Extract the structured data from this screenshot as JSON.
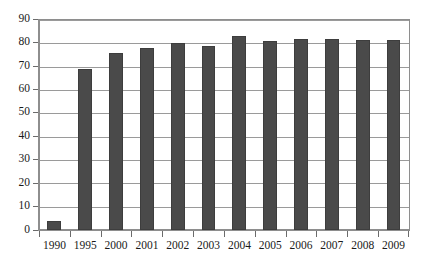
{
  "chart_data": {
    "type": "bar",
    "title": "",
    "subtitle": "",
    "xlabel": "",
    "ylabel": "",
    "categories": [
      "1990",
      "1995",
      "2000",
      "2001",
      "2002",
      "2003",
      "2004",
      "2005",
      "2006",
      "2007",
      "2008",
      "2009"
    ],
    "values": [
      4,
      69,
      76,
      78,
      80,
      79,
      83,
      81,
      82,
      82,
      81.5,
      81.5
    ],
    "series": [
      {
        "name": "",
        "values": [
          4,
          69,
          76,
          78,
          80,
          79,
          83,
          81,
          82,
          82,
          81.5,
          81.5
        ]
      }
    ],
    "ylim": [
      0,
      90
    ],
    "ytick_step": 10,
    "ytick_labels": [
      "90",
      "80",
      "70",
      "60",
      "50",
      "40",
      "30",
      "20",
      "10",
      "0"
    ],
    "ytick_values": [
      90,
      80,
      70,
      60,
      50,
      40,
      30,
      20,
      10,
      0
    ],
    "grid": true,
    "grid_axis": "y",
    "legend": false,
    "legend_position": "none",
    "annotations": [],
    "colors": {
      "bar_fill": "#4a4a4a",
      "bar_stroke": "#3d3d3d",
      "gridline": "#9a9a9a",
      "axis": "#8e8e8e",
      "plot_background": "#ffffff",
      "page_background": "#ffffff",
      "tick_label": "#1a1a1a"
    }
  }
}
